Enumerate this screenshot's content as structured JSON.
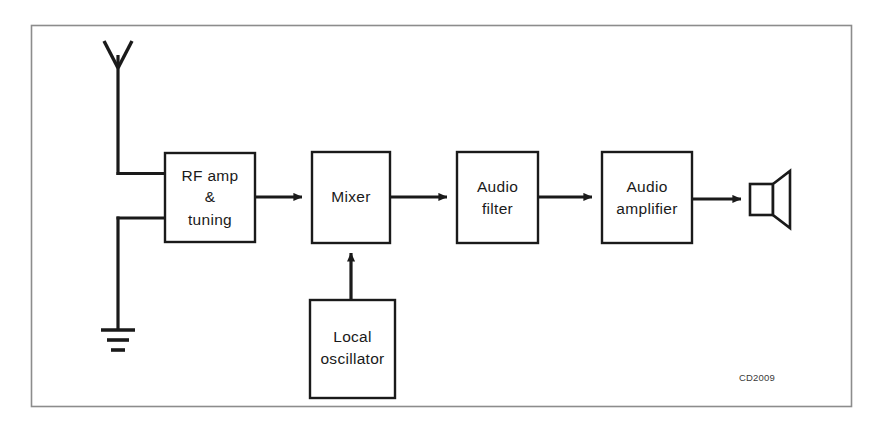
{
  "figure": {
    "caption_code": "CD2009",
    "border_color": "#8c8c8c",
    "ink_color": "#1a1a1a",
    "background": "#ffffff",
    "type": "superheterodyne-radio-receiver-block-diagram"
  },
  "blocks": [
    {
      "id": "rf-amp-tuning",
      "lines": [
        "RF amp",
        "&",
        "tuning"
      ],
      "x": 165,
      "y": 153,
      "w": 90,
      "h": 89
    },
    {
      "id": "mixer",
      "lines": [
        "Mixer"
      ],
      "x": 312,
      "y": 152,
      "w": 78,
      "h": 91
    },
    {
      "id": "local-oscillator",
      "lines": [
        "Local",
        "oscillator"
      ],
      "x": 310,
      "y": 300,
      "w": 85,
      "h": 98
    },
    {
      "id": "audio-filter",
      "lines": [
        "Audio",
        "filter"
      ],
      "x": 457,
      "y": 152,
      "w": 81,
      "h": 91
    },
    {
      "id": "audio-amplifier",
      "lines": [
        "Audio",
        "amplifier"
      ],
      "x": 602,
      "y": 152,
      "w": 90,
      "h": 91
    }
  ],
  "symbols": [
    {
      "id": "antenna",
      "label": "antenna",
      "x": 118,
      "y": 40
    },
    {
      "id": "ground",
      "label": "ground",
      "x": 118,
      "y": 330
    },
    {
      "id": "loudspeaker",
      "label": "loudspeaker",
      "x": 750,
      "y": 199
    }
  ],
  "connections": [
    {
      "id": "antenna-to-rf-amp",
      "from": "antenna",
      "to": "rf-amp-tuning",
      "arrow": false
    },
    {
      "id": "ground-to-rf-amp",
      "from": "ground",
      "to": "rf-amp-tuning",
      "arrow": false
    },
    {
      "id": "rf-amp-to-mixer",
      "from": "rf-amp-tuning",
      "to": "mixer",
      "arrow": true
    },
    {
      "id": "oscillator-to-mixer",
      "from": "local-oscillator",
      "to": "mixer",
      "arrow": true
    },
    {
      "id": "mixer-to-audio-filter",
      "from": "mixer",
      "to": "audio-filter",
      "arrow": true
    },
    {
      "id": "audio-filter-to-audio-amplifier",
      "from": "audio-filter",
      "to": "audio-amplifier",
      "arrow": true
    },
    {
      "id": "audio-amplifier-to-loudspeaker",
      "from": "audio-amplifier",
      "to": "loudspeaker",
      "arrow": true
    }
  ]
}
